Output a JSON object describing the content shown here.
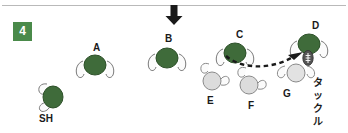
{
  "diagram": {
    "step_number": "4",
    "top_arrow_icon": "arrow-down-icon",
    "attack_direction": "down",
    "annotation_vertical": "タックル",
    "annotation_vertical_chars": [
      "タ",
      "ッ",
      "ク",
      "ル"
    ],
    "colors": {
      "team_attack": "#3f6b3a",
      "team_attack_dark": "#2d5029",
      "team_defence": "#d9d9d9",
      "team_defence_outline": "#6e6e6e",
      "badge": "#4a8a4a",
      "arrow": "#1a1a1a",
      "rule": "#b9b9b9",
      "ball": "#4a4a4a"
    },
    "players": [
      {
        "id": "SH",
        "label": "SH",
        "team": "attack",
        "x": 35,
        "y": 80,
        "label_x": 39,
        "label_y": 113,
        "has_ball": false,
        "orientation": "down"
      },
      {
        "id": "A",
        "label": "A",
        "team": "attack",
        "x": 74,
        "y": 52,
        "label_x": 93,
        "label_y": 42,
        "has_ball": false,
        "orientation": "down"
      },
      {
        "id": "B",
        "label": "B",
        "team": "attack",
        "x": 146,
        "y": 45,
        "label_x": 165,
        "label_y": 33,
        "has_ball": false,
        "orientation": "down"
      },
      {
        "id": "C",
        "label": "C",
        "team": "attack",
        "x": 214,
        "y": 40,
        "label_x": 236,
        "label_y": 29,
        "has_ball": false,
        "orientation": "down"
      },
      {
        "id": "D",
        "label": "D",
        "team": "attack",
        "x": 288,
        "y": 31,
        "label_x": 312,
        "label_y": 20,
        "has_ball": true,
        "orientation": "down"
      },
      {
        "id": "E",
        "label": "E",
        "team": "defence",
        "x": 195,
        "y": 65,
        "label_x": 207,
        "label_y": 95,
        "has_ball": false,
        "orientation": "up"
      },
      {
        "id": "F",
        "label": "F",
        "team": "defence",
        "x": 232,
        "y": 70,
        "label_x": 248,
        "label_y": 100,
        "has_ball": false,
        "orientation": "up"
      },
      {
        "id": "G",
        "label": "G",
        "team": "defence",
        "x": 272,
        "y": 60,
        "label_x": 283,
        "label_y": 88,
        "has_ball": false,
        "orientation": "up"
      }
    ],
    "pass": {
      "from": "C",
      "to": "D",
      "style": "dashed",
      "head": "arrow"
    }
  }
}
